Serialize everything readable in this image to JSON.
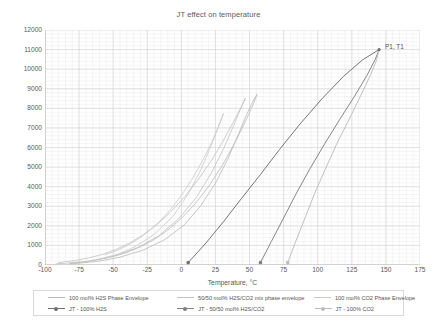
{
  "chart_data": {
    "type": "line",
    "title": "JT effect on temperature",
    "xlabel": "Temperature, °C",
    "ylabel": "Pressure, kPag",
    "xlim": [
      -100,
      175
    ],
    "ylim": [
      0,
      12000
    ],
    "xticks": [
      -100,
      -75,
      -50,
      -25,
      0,
      25,
      50,
      75,
      100,
      125,
      150,
      175
    ],
    "xtick_labels": [
      "-100",
      "-75",
      "-50",
      "-25",
      "0",
      "25",
      "50",
      "75",
      "100",
      "125",
      "150",
      "175"
    ],
    "yticks": [
      0,
      1000,
      2000,
      3000,
      4000,
      5000,
      6000,
      7000,
      8000,
      9000,
      10000,
      11000,
      12000
    ],
    "ytick_labels": [
      "0",
      "1000",
      "2000",
      "3000",
      "4000",
      "5000",
      "6000",
      "7000",
      "8000",
      "9000",
      "10000",
      "11000",
      "12000"
    ],
    "grid": true,
    "minor_grid": true,
    "minor_per_major_x": 5,
    "minor_per_major_y": 5,
    "legend_position": "below",
    "annotations": [
      {
        "text": "P1, T1",
        "x": 145,
        "y": 11000,
        "label_dx": 6,
        "label_dy": -3
      }
    ],
    "series": [
      {
        "name": "100 mol% H2S Phase Envelope",
        "color": "#b9b9b9",
        "style": "line",
        "marker": false,
        "points": [
          [
            -82,
            90
          ],
          [
            -70,
            170
          ],
          [
            -60,
            280
          ],
          [
            -50,
            430
          ],
          [
            -40,
            640
          ],
          [
            -30,
            930
          ],
          [
            -20,
            1300
          ],
          [
            -10,
            1780
          ],
          [
            0,
            2380
          ],
          [
            10,
            3120
          ],
          [
            20,
            4010
          ],
          [
            30,
            5080
          ],
          [
            40,
            6340
          ],
          [
            48,
            7480
          ],
          [
            53,
            8250
          ],
          [
            55.5,
            8720
          ],
          [
            54.5,
            8600
          ],
          [
            52,
            8300
          ],
          [
            48,
            7700
          ],
          [
            42,
            6700
          ],
          [
            34,
            5400
          ],
          [
            25,
            4180
          ],
          [
            14,
            3000
          ],
          [
            2,
            2040
          ],
          [
            -12,
            1300
          ],
          [
            -28,
            760
          ],
          [
            -45,
            400
          ],
          [
            -60,
            200
          ],
          [
            -75,
            90
          ],
          [
            -82,
            60
          ]
        ]
      },
      {
        "name": "50/50 mol% H2S/CO2 mix phase envelope",
        "color": "#c2c2c2",
        "style": "line",
        "marker": false,
        "points": [
          [
            -90,
            120
          ],
          [
            -78,
            230
          ],
          [
            -68,
            360
          ],
          [
            -58,
            540
          ],
          [
            -48,
            790
          ],
          [
            -38,
            1120
          ],
          [
            -28,
            1540
          ],
          [
            -18,
            2060
          ],
          [
            -8,
            2700
          ],
          [
            2,
            3450
          ],
          [
            12,
            4330
          ],
          [
            22,
            5330
          ],
          [
            30,
            6260
          ],
          [
            38,
            7280
          ],
          [
            44,
            8090
          ],
          [
            47,
            8530
          ],
          [
            46,
            8380
          ],
          [
            43,
            7900
          ],
          [
            38,
            7070
          ],
          [
            31,
            5950
          ],
          [
            22,
            4700
          ],
          [
            11,
            3450
          ],
          [
            -2,
            2360
          ],
          [
            -17,
            1470
          ],
          [
            -33,
            860
          ],
          [
            -50,
            450
          ],
          [
            -68,
            200
          ],
          [
            -85,
            90
          ],
          [
            -92,
            60
          ]
        ]
      },
      {
        "name": "100 mol% CO2 Phase Envelope",
        "color": "#c9c9c9",
        "style": "line",
        "marker": false,
        "points": [
          [
            -56,
            520
          ],
          [
            -48,
            720
          ],
          [
            -40,
            980
          ],
          [
            -32,
            1310
          ],
          [
            -24,
            1720
          ],
          [
            -16,
            2220
          ],
          [
            -8,
            2830
          ],
          [
            0,
            3550
          ],
          [
            8,
            4400
          ],
          [
            16,
            5390
          ],
          [
            22,
            6230
          ],
          [
            27,
            7030
          ],
          [
            30,
            7560
          ],
          [
            31,
            7740
          ],
          [
            30.5,
            7660
          ],
          [
            29,
            7400
          ],
          [
            26,
            6850
          ],
          [
            21,
            5950
          ],
          [
            14,
            4830
          ],
          [
            5,
            3620
          ],
          [
            -6,
            2500
          ],
          [
            -20,
            1560
          ],
          [
            -34,
            930
          ],
          [
            -46,
            560
          ],
          [
            -56,
            380
          ]
        ]
      },
      {
        "name": "JT - 100% H2S",
        "color": "#6f6f6f",
        "style": "line",
        "marker": true,
        "points": [
          [
            5,
            120
          ],
          [
            18,
            1120
          ],
          [
            31,
            2220
          ],
          [
            44,
            3390
          ],
          [
            58,
            4620
          ],
          [
            72,
            5900
          ],
          [
            87,
            7200
          ],
          [
            103,
            8480
          ],
          [
            119,
            9640
          ],
          [
            133,
            10480
          ],
          [
            145,
            11000
          ]
        ]
      },
      {
        "name": "JT - 50/50 mol% H2S/CO2",
        "color": "#808080",
        "style": "line",
        "marker": true,
        "points": [
          [
            58,
            120
          ],
          [
            66,
            1200
          ],
          [
            75,
            2400
          ],
          [
            84,
            3620
          ],
          [
            94,
            4880
          ],
          [
            105,
            6180
          ],
          [
            116,
            7420
          ],
          [
            127,
            8620
          ],
          [
            136,
            9670
          ],
          [
            142,
            10470
          ],
          [
            145,
            11000
          ]
        ]
      },
      {
        "name": "JT - 100% CO2",
        "color": "#bdbdbd",
        "style": "line",
        "marker": true,
        "points": [
          [
            78,
            120
          ],
          [
            84,
            1230
          ],
          [
            91,
            2460
          ],
          [
            98,
            3700
          ],
          [
            106,
            4960
          ],
          [
            114,
            6200
          ],
          [
            123,
            7430
          ],
          [
            131,
            8580
          ],
          [
            138,
            9600
          ],
          [
            143,
            10430
          ],
          [
            145,
            11000
          ]
        ]
      }
    ]
  },
  "legend": {
    "rows": [
      [
        {
          "label": "100 mol% H2S Phase Envelope",
          "color": "#b9b9b9",
          "marker": false
        },
        {
          "label": "50/50 mol% H2S/CO2 mix phase envelope",
          "color": "#c2c2c2",
          "marker": false
        },
        {
          "label": "100 mol% CO2 Phase Envelope",
          "color": "#c9c9c9",
          "marker": false
        }
      ],
      [
        {
          "label": "JT - 100% H2S",
          "color": "#6f6f6f",
          "marker": true
        },
        {
          "label": "JT - 50/50 mol% H2S/CO2",
          "color": "#808080",
          "marker": true
        },
        {
          "label": "JT - 100% CO2",
          "color": "#bdbdbd",
          "marker": true
        }
      ]
    ]
  },
  "colors": {
    "major_grid": "#d4d4d4",
    "minor_grid": "#ebebeb",
    "axis": "#b0b0b0",
    "text": "#595959"
  }
}
